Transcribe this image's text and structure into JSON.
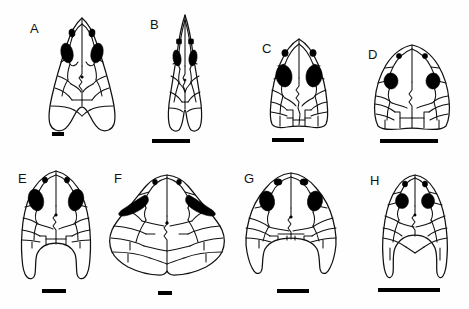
{
  "figure": {
    "type": "scientific-figure-plate",
    "background_color": "#ffffff",
    "line_color": "#111111",
    "fill_color": "#000000",
    "rows": 2,
    "columns": 4,
    "panel_count": 8
  },
  "panels": [
    {
      "label": "A",
      "row": 1,
      "column": 1,
      "label_x": 30,
      "label_y": 22,
      "shape": "elongate-triangular-pointed-snout",
      "orbit_style": "elongate-oval",
      "scalebar": {
        "x": 52,
        "y": 132,
        "width": 12,
        "height": 4
      }
    },
    {
      "label": "B",
      "row": 1,
      "column": 2,
      "label_x": 150,
      "label_y": 18,
      "shape": "very-narrow-elongate-acuminate-snout",
      "orbit_style": "narrow-oval",
      "scalebar": {
        "x": 152,
        "y": 139,
        "width": 38,
        "height": 4
      }
    },
    {
      "label": "C",
      "row": 1,
      "column": 3,
      "label_x": 262,
      "label_y": 42,
      "shape": "parabolic-broad-rounded-snout",
      "orbit_style": "large-oval",
      "scalebar": {
        "x": 272,
        "y": 138,
        "width": 32,
        "height": 4
      }
    },
    {
      "label": "D",
      "row": 1,
      "column": 4,
      "label_x": 368,
      "label_y": 48,
      "shape": "broad-domed-rounded",
      "orbit_style": "round",
      "scalebar": {
        "x": 380,
        "y": 139,
        "width": 58,
        "height": 4
      }
    },
    {
      "label": "E",
      "row": 2,
      "column": 1,
      "label_x": 18,
      "label_y": 172,
      "shape": "emarginate-posterior-with-horns",
      "orbit_style": "large-oval",
      "scalebar": {
        "x": 42,
        "y": 289,
        "width": 24,
        "height": 4
      }
    },
    {
      "label": "F",
      "row": 2,
      "column": 2,
      "label_x": 114,
      "label_y": 172,
      "shape": "very-broad-wide-flaring",
      "orbit_style": "elongate-triangular",
      "scalebar": {
        "x": 158,
        "y": 291,
        "width": 14,
        "height": 4
      }
    },
    {
      "label": "G",
      "row": 2,
      "column": 3,
      "label_x": 244,
      "label_y": 172,
      "shape": "broad-emarginate-with-horns",
      "orbit_style": "large-oval",
      "scalebar": {
        "x": 277,
        "y": 289,
        "width": 32,
        "height": 4
      }
    },
    {
      "label": "H",
      "row": 2,
      "column": 4,
      "label_x": 370,
      "label_y": 174,
      "shape": "narrow-deeply-emarginate-with-long-horns",
      "orbit_style": "round",
      "scalebar": {
        "x": 378,
        "y": 288,
        "width": 62,
        "height": 4
      }
    }
  ]
}
